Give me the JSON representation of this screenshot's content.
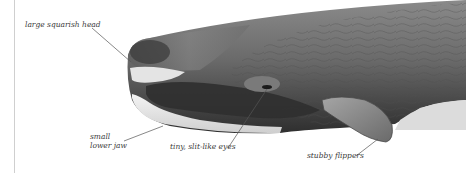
{
  "figure": {
    "annotations": [
      {
        "id": "head",
        "text": "large squarish head"
      },
      {
        "id": "jaw",
        "lines": [
          "small",
          "lower jaw"
        ]
      },
      {
        "id": "eyes",
        "text": "tiny, slit-like eyes"
      },
      {
        "id": "flippers",
        "text": "stubby flippers"
      }
    ]
  },
  "colors": {
    "background": "#ffffff",
    "body_dark": "#4a4a4a",
    "body_mid": "#6e6e6e",
    "body_light": "#9a9a9a",
    "jaw_white": "#ececec",
    "leader_line": "#555555",
    "label_text": "#3a3a3a",
    "margin_rule": "#cfcfcf"
  }
}
